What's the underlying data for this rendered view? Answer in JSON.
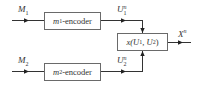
{
  "diagram": {
    "inputs": [
      {
        "symbol": "M",
        "subscript": "1"
      },
      {
        "symbol": "M",
        "subscript": "2"
      }
    ],
    "encoders": [
      {
        "label_prefix": "m",
        "label_sub": "1",
        "label_suffix": "-encoder"
      },
      {
        "label_prefix": "m",
        "label_sub": "2",
        "label_suffix": "-encoder"
      }
    ],
    "codewords": [
      {
        "symbol": "U",
        "superscript": "n",
        "subscript": "1"
      },
      {
        "symbol": "U",
        "superscript": "n",
        "subscript": "2"
      }
    ],
    "combiner": {
      "func": "x",
      "args_open": " (U",
      "sub1": "1",
      "comma": ", U",
      "sub2": "2",
      "args_close": ")"
    },
    "output": {
      "symbol": "X",
      "superscript": "n"
    },
    "colors": {
      "line": "#333333",
      "box_border": "#6a6a6a"
    }
  }
}
